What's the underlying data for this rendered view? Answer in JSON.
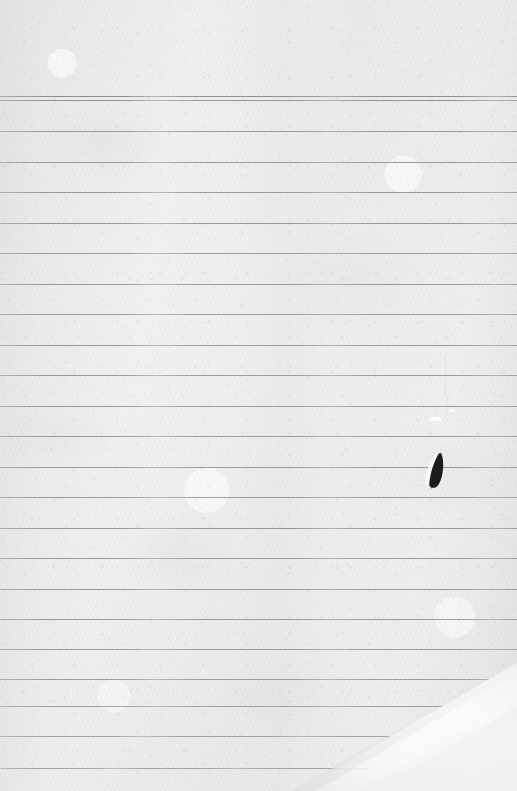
{
  "document": {
    "kind": "scanned-lined-paper",
    "title": "Scanned blank ruled notebook paper",
    "width": 517,
    "height": 791,
    "visible_text": "",
    "handwriting_present": false,
    "background_color": "#efefef",
    "paper_tone_light": "#f4f4f4",
    "paper_tone_dark": "#e7e7e7",
    "rule_color": "#6d6f72",
    "ink_color": "#0d0d0d"
  },
  "top_margin": {
    "label": "blank header margin above first rule",
    "height": 95
  },
  "ruling": {
    "style": "wide-ruled horizontal lines, full bleed left to right",
    "line_count": 24,
    "spacing": 30.5,
    "first_line_y": 96,
    "header_double_rule": true,
    "header_rule_gap": 4,
    "lines": [
      {
        "y": 96,
        "x_start": 0,
        "x_end": 517,
        "opacity": 0.78
      },
      {
        "y": 100,
        "x_start": 0,
        "x_end": 517,
        "opacity": 0.72
      },
      {
        "y": 131,
        "x_start": 0,
        "x_end": 517,
        "opacity": 0.7
      },
      {
        "y": 162,
        "x_start": 0,
        "x_end": 517,
        "opacity": 0.72
      },
      {
        "y": 192,
        "x_start": 0,
        "x_end": 517,
        "opacity": 0.7
      },
      {
        "y": 223,
        "x_start": 0,
        "x_end": 517,
        "opacity": 0.72
      },
      {
        "y": 253,
        "x_start": 0,
        "x_end": 517,
        "opacity": 0.7
      },
      {
        "y": 284,
        "x_start": 0,
        "x_end": 517,
        "opacity": 0.72
      },
      {
        "y": 314,
        "x_start": 0,
        "x_end": 517,
        "opacity": 0.7
      },
      {
        "y": 345,
        "x_start": 0,
        "x_end": 517,
        "opacity": 0.72
      },
      {
        "y": 375,
        "x_start": 0,
        "x_end": 517,
        "opacity": 0.7
      },
      {
        "y": 406,
        "x_start": 0,
        "x_end": 517,
        "opacity": 0.72
      },
      {
        "y": 436,
        "x_start": 0,
        "x_end": 517,
        "opacity": 0.7
      },
      {
        "y": 467,
        "x_start": 0,
        "x_end": 517,
        "opacity": 0.72
      },
      {
        "y": 497,
        "x_start": 0,
        "x_end": 517,
        "opacity": 0.7
      },
      {
        "y": 528,
        "x_start": 0,
        "x_end": 517,
        "opacity": 0.72
      },
      {
        "y": 558,
        "x_start": 0,
        "x_end": 517,
        "opacity": 0.7
      },
      {
        "y": 589,
        "x_start": 0,
        "x_end": 517,
        "opacity": 0.72
      },
      {
        "y": 619,
        "x_start": 0,
        "x_end": 517,
        "opacity": 0.7
      },
      {
        "y": 649,
        "x_start": 0,
        "x_end": 517,
        "opacity": 0.68
      },
      {
        "y": 679,
        "x_start": 0,
        "x_end": 517,
        "opacity": 0.66
      },
      {
        "y": 706,
        "x_start": 0,
        "x_end": 517,
        "opacity": 0.64
      },
      {
        "y": 736,
        "x_start": 0,
        "x_end": 470,
        "opacity": 0.6
      },
      {
        "y": 768,
        "x_start": 0,
        "x_end": 372,
        "opacity": 0.58
      }
    ]
  },
  "marks": {
    "ink_stroke": {
      "label": "small dark ink slash / pen mark",
      "x": 424,
      "y": 449,
      "width": 24,
      "height": 38,
      "rotation_deg": 14,
      "color": "#0b0b0b",
      "highlight_color": "#fbfbfb"
    },
    "creases": [
      {
        "label": "faint vertical crease",
        "x": 445,
        "y": 350,
        "width": 1,
        "height": 46,
        "opacity": 0.3
      },
      {
        "label": "faint short crease",
        "x": 447,
        "y": 398,
        "width": 1,
        "height": 18,
        "opacity": 0.22
      }
    ],
    "light_flecks": [
      {
        "label": "light scuff fleck",
        "x": 430,
        "y": 417,
        "width": 11,
        "height": 4
      },
      {
        "label": "light scuff fleck",
        "x": 449,
        "y": 409,
        "width": 6,
        "height": 3
      }
    ]
  },
  "fold_corner": {
    "label": "folded / lifted paper corner, bottom right",
    "position": "bottom-right",
    "edge_from_x": 300,
    "edge_from_y": 791,
    "edge_to_x": 517,
    "edge_to_y": 668,
    "highlight_color": "#fdfdfd",
    "shadow_color": "#dcdcdc"
  }
}
